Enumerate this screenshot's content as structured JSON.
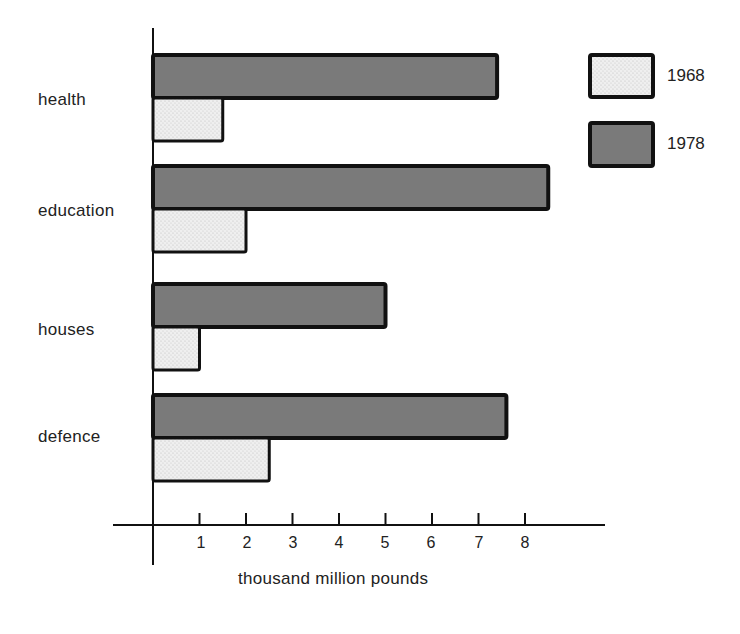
{
  "chart_data": {
    "type": "bar",
    "orientation": "horizontal",
    "title": "",
    "categories": [
      "health",
      "education",
      "houses",
      "defence"
    ],
    "series": [
      {
        "name": "1968",
        "values": [
          1.5,
          2.0,
          1.0,
          2.5
        ],
        "color": "#ececec",
        "pattern": "stippled-light"
      },
      {
        "name": "1978",
        "values": [
          7.4,
          8.5,
          5.0,
          7.6
        ],
        "color": "#7a7a7a",
        "pattern": "solid-dark"
      }
    ],
    "xlabel": "thousand million pounds",
    "ylabel": "",
    "xticks": [
      "1",
      "2",
      "3",
      "4",
      "5",
      "6",
      "7",
      "8"
    ],
    "xlim": [
      0,
      9.7
    ],
    "grid": false,
    "legend": {
      "position": "top-right",
      "entries": [
        "1968",
        "1978"
      ]
    }
  },
  "labels": {
    "categories": [
      "health",
      "education",
      "houses",
      "defence"
    ],
    "xticks": [
      "1",
      "2",
      "3",
      "4",
      "5",
      "6",
      "7",
      "8"
    ],
    "xlabel": "thousand million pounds",
    "legend": [
      "1968",
      "1978"
    ]
  },
  "colors": {
    "dark_bar": "#7a7a7a",
    "light_bar": "#ececec",
    "outline": "#111111"
  }
}
